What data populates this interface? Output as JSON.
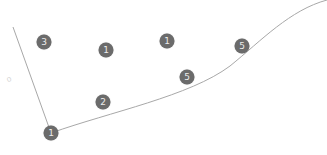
{
  "diagram": {
    "line_color": "#a8a8a8",
    "marker_color": "#6b6b6b",
    "marker_text_color": "#ececec",
    "lines": [
      {
        "name": "left-segment",
        "d": "M 13 27 L 51 133"
      },
      {
        "name": "main-curve",
        "d": "M 51 133 C 110 112, 190 96, 230 66 C 262 40, 290 10, 327 0"
      }
    ],
    "markers": [
      {
        "label": "3",
        "x": 44,
        "y": 42
      },
      {
        "label": "1",
        "x": 106,
        "y": 50
      },
      {
        "label": "1",
        "x": 167,
        "y": 41
      },
      {
        "label": "5",
        "x": 242,
        "y": 46
      },
      {
        "label": "5",
        "x": 187,
        "y": 77
      },
      {
        "label": "2",
        "x": 103,
        "y": 102
      },
      {
        "label": "1",
        "x": 51,
        "y": 133
      }
    ],
    "faint_glyph": {
      "text": "o",
      "x": 9,
      "y": 79
    }
  }
}
